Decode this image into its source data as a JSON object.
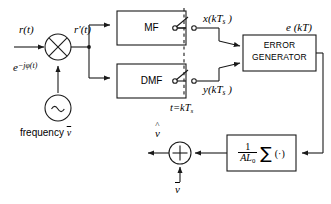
{
  "diagram": {
    "type": "signal-flow-block-diagram",
    "stroke_color": "#1a1a1a",
    "background": "#ffffff"
  },
  "signals": {
    "input": "r(t)",
    "mixed": "r'(t)",
    "mixer_lo": {
      "base": "e",
      "exponent": "−jφ(t)"
    },
    "oscillator_caption": "frequency",
    "oscillator_symbol": "ν",
    "oscillator_glyph": "~",
    "mf_output_sample": {
      "name": "x",
      "arg": "(kT",
      "sub": "s",
      "close": " )"
    },
    "dmf_output_sample": {
      "name": "y",
      "arg": "(kT",
      "sub": "s",
      "close": " )"
    },
    "sampling_instant": {
      "lhs": "t=kT",
      "sub": "s"
    },
    "error_signal": "e (kT)",
    "estimate_out": "ν",
    "feedback_in": "ν"
  },
  "blocks": {
    "matched_filter": "MF",
    "derivative_matched_filter": "DMF",
    "error_generator_line1": "ERROR",
    "error_generator_line2": "GENERATOR",
    "loop_filter": {
      "numerator": "1",
      "denominator_a": "AL",
      "denominator_sub": "0",
      "sigma": "∑",
      "operand": "(·)"
    }
  },
  "symbols": {
    "multiplier": "⊗",
    "adder": "⊕"
  }
}
